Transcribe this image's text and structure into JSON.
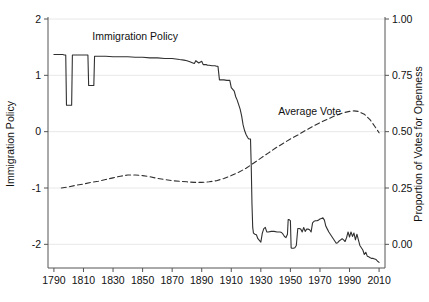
{
  "chart_data": {
    "type": "line",
    "title": "",
    "xlabel": "",
    "ylabel": "Immigration Policy",
    "ylabel_right": "Proportion of Votes for Openness",
    "xlim": [
      1786,
      2014
    ],
    "ylim": [
      -2.42,
      2.0
    ],
    "ylim_right": [
      -0.105,
      1.0
    ],
    "grid": true,
    "grid_axis": "y",
    "legend": "inline-annotations",
    "xticks": [
      1790,
      1810,
      1830,
      1850,
      1870,
      1890,
      1910,
      1930,
      1950,
      1970,
      1990,
      2010
    ],
    "xticklabels": [
      "1790",
      "1810",
      "1830",
      "1850",
      "1870",
      "1890",
      "1910",
      "1930",
      "1950",
      "1970",
      "1990",
      "2010"
    ],
    "yticks": [
      -2,
      -1,
      0,
      1,
      2
    ],
    "yticklabels": [
      "-2",
      "-1",
      "0",
      "1",
      "2"
    ],
    "yticks_right": [
      0.0,
      0.25,
      0.5,
      0.75,
      1.0
    ],
    "yticklabels_right": [
      "0.00",
      "0.25",
      "0.50",
      "0.75",
      "1.00"
    ],
    "annotations": [
      {
        "text": "Immigration Policy",
        "x": 1845,
        "y": 1.62
      },
      {
        "text": "Average Vote",
        "x": 1963,
        "y": 0.3
      }
    ],
    "series": [
      {
        "name": "Immigration Policy",
        "axis": "left",
        "style": "solid",
        "color": "#303030",
        "points": [
          [
            1790,
            1.37
          ],
          [
            1795,
            1.37
          ],
          [
            1796,
            1.37
          ],
          [
            1797,
            1.36
          ],
          [
            1798,
            1.36
          ],
          [
            1798.5,
            0.47
          ],
          [
            1801,
            0.47
          ],
          [
            1802,
            0.47
          ],
          [
            1802.5,
            1.36
          ],
          [
            1805,
            1.36
          ],
          [
            1808,
            1.36
          ],
          [
            1810,
            1.36
          ],
          [
            1812,
            1.36
          ],
          [
            1813,
            1.36
          ],
          [
            1813.5,
            0.82
          ],
          [
            1816,
            0.82
          ],
          [
            1817,
            0.82
          ],
          [
            1817.5,
            1.34
          ],
          [
            1820,
            1.34
          ],
          [
            1825,
            1.34
          ],
          [
            1830,
            1.33
          ],
          [
            1835,
            1.33
          ],
          [
            1840,
            1.33
          ],
          [
            1845,
            1.32
          ],
          [
            1850,
            1.32
          ],
          [
            1855,
            1.31
          ],
          [
            1860,
            1.31
          ],
          [
            1865,
            1.3
          ],
          [
            1870,
            1.3
          ],
          [
            1875,
            1.28
          ],
          [
            1878,
            1.27
          ],
          [
            1880,
            1.26
          ],
          [
            1882,
            1.24
          ],
          [
            1884,
            1.22
          ],
          [
            1885,
            1.21
          ],
          [
            1886,
            1.26
          ],
          [
            1888,
            1.22
          ],
          [
            1890,
            1.25
          ],
          [
            1891,
            1.19
          ],
          [
            1893,
            1.19
          ],
          [
            1894,
            1.18
          ],
          [
            1895,
            1.18
          ],
          [
            1897,
            1.17
          ],
          [
            1899,
            1.17
          ],
          [
            1900,
            1.16
          ],
          [
            1901,
            1.16
          ],
          [
            1902,
            0.92
          ],
          [
            1905,
            0.92
          ],
          [
            1907,
            0.91
          ],
          [
            1909,
            0.91
          ],
          [
            1910,
            0.78
          ],
          [
            1912,
            0.72
          ],
          [
            1913,
            0.62
          ],
          [
            1914,
            0.56
          ],
          [
            1915,
            0.48
          ],
          [
            1916,
            0.4
          ],
          [
            1917,
            0.28
          ],
          [
            1918,
            0.12
          ],
          [
            1919,
            0.02
          ],
          [
            1920,
            -0.05
          ],
          [
            1921,
            -0.1
          ],
          [
            1921.5,
            -0.12
          ],
          [
            1922,
            -0.13
          ],
          [
            1923,
            -0.13
          ],
          [
            1923.5,
            -0.6
          ],
          [
            1924,
            -1.28
          ],
          [
            1924.5,
            -1.7
          ],
          [
            1925,
            -1.8
          ],
          [
            1926,
            -1.82
          ],
          [
            1927,
            -1.83
          ],
          [
            1928,
            -1.9
          ],
          [
            1929,
            -1.93
          ],
          [
            1930,
            -1.96
          ],
          [
            1931,
            -1.8
          ],
          [
            1932,
            -1.72
          ],
          [
            1933,
            -1.7
          ],
          [
            1934,
            -1.78
          ],
          [
            1935,
            -1.78
          ],
          [
            1937,
            -1.77
          ],
          [
            1939,
            -1.77
          ],
          [
            1941,
            -1.78
          ],
          [
            1943,
            -1.78
          ],
          [
            1944,
            -1.79
          ],
          [
            1945,
            -1.82
          ],
          [
            1946,
            -1.86
          ],
          [
            1947,
            -1.88
          ],
          [
            1948,
            -1.82
          ],
          [
            1948.5,
            -1.56
          ],
          [
            1949,
            -1.56
          ],
          [
            1949.5,
            -1.57
          ],
          [
            1950,
            -1.58
          ],
          [
            1950.5,
            -2.06
          ],
          [
            1951,
            -2.07
          ],
          [
            1952,
            -2.07
          ],
          [
            1953,
            -2.06
          ],
          [
            1954,
            -2.02
          ],
          [
            1955,
            -1.72
          ],
          [
            1956,
            -1.72
          ],
          [
            1957,
            -1.73
          ],
          [
            1958,
            -1.78
          ],
          [
            1959,
            -1.7
          ],
          [
            1960,
            -1.77
          ],
          [
            1961,
            -1.73
          ],
          [
            1962,
            -1.73
          ],
          [
            1963,
            -1.74
          ],
          [
            1964,
            -1.78
          ],
          [
            1965,
            -1.62
          ],
          [
            1966,
            -1.59
          ],
          [
            1967,
            -1.58
          ],
          [
            1968,
            -1.58
          ],
          [
            1969,
            -1.57
          ],
          [
            1970,
            -1.55
          ],
          [
            1971,
            -1.54
          ],
          [
            1972,
            -1.53
          ],
          [
            1973,
            -1.57
          ],
          [
            1974,
            -1.68
          ],
          [
            1975,
            -1.73
          ],
          [
            1976,
            -1.78
          ],
          [
            1977,
            -1.82
          ],
          [
            1978,
            -1.86
          ],
          [
            1979,
            -1.9
          ],
          [
            1980,
            -1.94
          ],
          [
            1981,
            -1.98
          ],
          [
            1982,
            -1.97
          ],
          [
            1983,
            -1.94
          ],
          [
            1984,
            -1.92
          ],
          [
            1985,
            -1.9
          ],
          [
            1986,
            -1.92
          ],
          [
            1987,
            -1.95
          ],
          [
            1988,
            -1.88
          ],
          [
            1989,
            -1.78
          ],
          [
            1990,
            -1.87
          ],
          [
            1991,
            -1.78
          ],
          [
            1992,
            -1.86
          ],
          [
            1993,
            -1.8
          ],
          [
            1994,
            -1.92
          ],
          [
            1995,
            -1.82
          ],
          [
            1996,
            -1.92
          ],
          [
            1997,
            -2.02
          ],
          [
            1998,
            -2.06
          ],
          [
            1999,
            -2.1
          ],
          [
            2000,
            -2.18
          ],
          [
            2001,
            -2.14
          ],
          [
            2002,
            -2.21
          ],
          [
            2003,
            -2.22
          ],
          [
            2004,
            -2.24
          ],
          [
            2005,
            -2.25
          ],
          [
            2006,
            -2.25
          ],
          [
            2007,
            -2.26
          ],
          [
            2008,
            -2.27
          ],
          [
            2009,
            -2.3
          ],
          [
            2010,
            -2.32
          ]
        ]
      },
      {
        "name": "Average Vote",
        "axis": "left",
        "style": "dashed",
        "color": "#303030",
        "points": [
          [
            1795,
            -1.0
          ],
          [
            1800,
            -0.98
          ],
          [
            1805,
            -0.95
          ],
          [
            1810,
            -0.93
          ],
          [
            1815,
            -0.9
          ],
          [
            1820,
            -0.88
          ],
          [
            1825,
            -0.85
          ],
          [
            1830,
            -0.82
          ],
          [
            1835,
            -0.79
          ],
          [
            1840,
            -0.77
          ],
          [
            1845,
            -0.77
          ],
          [
            1850,
            -0.78
          ],
          [
            1855,
            -0.8
          ],
          [
            1860,
            -0.83
          ],
          [
            1865,
            -0.85
          ],
          [
            1870,
            -0.87
          ],
          [
            1875,
            -0.88
          ],
          [
            1880,
            -0.89
          ],
          [
            1885,
            -0.9
          ],
          [
            1890,
            -0.9
          ],
          [
            1895,
            -0.89
          ],
          [
            1900,
            -0.87
          ],
          [
            1905,
            -0.83
          ],
          [
            1910,
            -0.78
          ],
          [
            1915,
            -0.72
          ],
          [
            1920,
            -0.65
          ],
          [
            1925,
            -0.56
          ],
          [
            1930,
            -0.47
          ],
          [
            1935,
            -0.38
          ],
          [
            1940,
            -0.29
          ],
          [
            1945,
            -0.21
          ],
          [
            1950,
            -0.13
          ],
          [
            1955,
            -0.06
          ],
          [
            1960,
            0.02
          ],
          [
            1965,
            0.09
          ],
          [
            1970,
            0.16
          ],
          [
            1975,
            0.22
          ],
          [
            1980,
            0.28
          ],
          [
            1985,
            0.33
          ],
          [
            1990,
            0.36
          ],
          [
            1993,
            0.37
          ],
          [
            1996,
            0.36
          ],
          [
            2000,
            0.31
          ],
          [
            2004,
            0.21
          ],
          [
            2008,
            0.06
          ],
          [
            2010,
            -0.02
          ]
        ]
      }
    ]
  }
}
